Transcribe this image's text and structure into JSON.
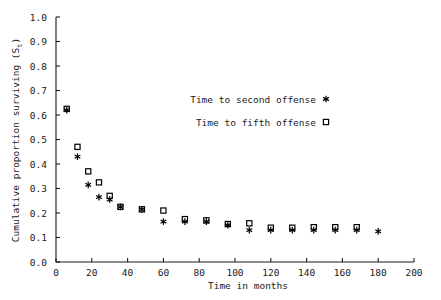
{
  "chart_data": {
    "type": "scatter",
    "title": "",
    "xlabel": "Time in months",
    "ylabel": "Cumulative proportion surviving (Sₜ)",
    "ylabel_text": "Cumulative proportion surviving (S",
    "ylabel_sub": "t",
    "ylabel_tail": ")",
    "xlim": [
      0,
      200
    ],
    "ylim": [
      0.0,
      1.0
    ],
    "grid": false,
    "legend_position": "upper-center-right",
    "xticks": [
      0,
      20,
      40,
      60,
      80,
      100,
      120,
      140,
      160,
      180,
      200
    ],
    "xtick_labels": [
      "0",
      "20",
      "40",
      "60",
      "80",
      "100",
      "120",
      "140",
      "160",
      "180",
      "200"
    ],
    "yticks": [
      0.0,
      0.1,
      0.2,
      0.3,
      0.4,
      0.5,
      0.6,
      0.7,
      0.8,
      0.9,
      1.0
    ],
    "ytick_labels": [
      "0.0",
      "0.1",
      "0.2",
      "0.3",
      "0.4",
      "0.5",
      "0.6",
      "0.7",
      "0.8",
      "0.9",
      "1.0"
    ],
    "x": [
      6,
      12,
      18,
      24,
      30,
      36,
      48,
      60,
      72,
      84,
      96,
      108,
      120,
      132,
      144,
      156,
      168,
      180
    ],
    "series": [
      {
        "name": "Time to second offense",
        "marker": "star",
        "color": "#000000",
        "x": [
          6,
          12,
          18,
          24,
          30,
          36,
          48,
          60,
          72,
          84,
          96,
          108,
          120,
          132,
          144,
          156,
          168,
          180
        ],
        "values": [
          0.62,
          0.43,
          0.315,
          0.265,
          0.255,
          0.225,
          0.215,
          0.165,
          0.165,
          0.165,
          0.15,
          0.13,
          0.13,
          0.13,
          0.13,
          0.13,
          0.13,
          0.125
        ]
      },
      {
        "name": "Time to fifth offense",
        "marker": "square",
        "color": "#000000",
        "x": [
          6,
          12,
          18,
          24,
          30,
          36,
          48,
          60,
          72,
          84,
          96,
          108,
          120,
          132,
          144,
          156,
          168
        ],
        "values": [
          0.625,
          0.47,
          0.37,
          0.325,
          0.27,
          0.225,
          0.215,
          0.21,
          0.175,
          0.17,
          0.155,
          0.158,
          0.14,
          0.14,
          0.142,
          0.142,
          0.142
        ]
      }
    ],
    "legend": [
      {
        "label": "Time to second offense",
        "marker": "star"
      },
      {
        "label": "Time to fifth offense",
        "marker": "square"
      }
    ]
  }
}
